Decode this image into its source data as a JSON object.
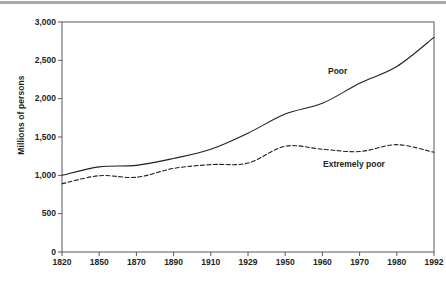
{
  "figure": {
    "background_color": "#ffffff",
    "ink_color": "#231f20",
    "top_rule_color": "#a7a9ac"
  },
  "chart_data": {
    "type": "line",
    "title": "",
    "subtitle": "",
    "xlabel": "",
    "ylabel": "Millions of persons",
    "categories": [
      "1820",
      "1850",
      "1870",
      "1890",
      "1910",
      "1929",
      "1950",
      "1960",
      "1970",
      "1980",
      "1992"
    ],
    "ylim": [
      0,
      3000
    ],
    "y_ticks": [
      0,
      500,
      1000,
      1500,
      2000,
      2500,
      3000
    ],
    "y_tick_labels": [
      "0",
      "500",
      "1,000",
      "1,500",
      "2,000",
      "2,500",
      "3,000"
    ],
    "grid": false,
    "legend_position": "inline-annotation",
    "series": [
      {
        "name": "Poor",
        "style": "solid",
        "color": "#231f20",
        "values": [
          1000,
          1110,
          1130,
          1220,
          1340,
          1550,
          1800,
          1940,
          2200,
          2420,
          2800
        ]
      },
      {
        "name": "Extremely poor",
        "style": "dashed",
        "color": "#231f20",
        "values": [
          890,
          995,
          975,
          1090,
          1140,
          1160,
          1380,
          1340,
          1310,
          1400,
          1300
        ]
      }
    ],
    "annotations": [
      {
        "text": "Poor",
        "category": "1970",
        "value": 2300
      },
      {
        "text": "Extremely poor",
        "category": "1970",
        "value": 1180
      }
    ]
  }
}
